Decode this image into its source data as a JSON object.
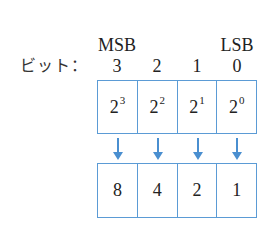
{
  "header": {
    "msb_label": "MSB",
    "lsb_label": "LSB",
    "bit_label": "ビット：",
    "bit_positions": [
      "3",
      "2",
      "1",
      "0"
    ]
  },
  "powers": [
    {
      "base": "2",
      "exp": "3"
    },
    {
      "base": "2",
      "exp": "2"
    },
    {
      "base": "2",
      "exp": "1"
    },
    {
      "base": "2",
      "exp": "0"
    }
  ],
  "values": [
    "8",
    "4",
    "2",
    "1"
  ],
  "colors": {
    "box_border": "#5b9bd5",
    "arrow": "#4a8fd0"
  }
}
